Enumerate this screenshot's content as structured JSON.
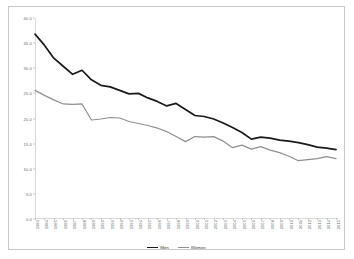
{
  "chart_data": {
    "type": "line",
    "title": "",
    "xlabel": "",
    "ylabel": "",
    "ylim": [
      0.0,
      40.0
    ],
    "yticks": [
      "0.0",
      "5.0",
      "10.0",
      "15.0",
      "20.0",
      "25.0",
      "30.0",
      "35.0",
      "40.0"
    ],
    "grid": false,
    "legend_position": "bottom",
    "x": [
      "1983",
      "1984",
      "1985",
      "1986",
      "1987",
      "1988",
      "1989",
      "1990",
      "1991",
      "1992",
      "1993",
      "1994",
      "1995",
      "1996",
      "1997",
      "1998",
      "1999",
      "2000",
      "2001",
      "2002",
      "2003",
      "2004",
      "2005",
      "2006",
      "2007",
      "2008",
      "2009",
      "2010",
      "2011",
      "2012",
      "2013",
      "2014",
      "2015"
    ],
    "series": [
      {
        "name": "Men",
        "color": "#1a1a1a",
        "values": [
          36.8,
          34.6,
          32.0,
          30.4,
          28.8,
          29.6,
          27.7,
          26.6,
          26.3,
          25.6,
          24.9,
          25.0,
          24.1,
          23.4,
          22.5,
          23.0,
          21.8,
          20.6,
          20.4,
          19.9,
          19.1,
          18.2,
          17.2,
          15.9,
          16.3,
          16.1,
          15.7,
          15.5,
          15.2,
          14.8,
          14.3,
          14.1,
          13.8
        ]
      },
      {
        "name": "Women",
        "color": "#8f8f8f",
        "values": [
          25.6,
          24.6,
          23.7,
          22.9,
          22.8,
          22.9,
          19.7,
          19.9,
          20.2,
          20.1,
          19.4,
          19.0,
          18.6,
          18.1,
          17.4,
          16.4,
          15.4,
          16.4,
          16.3,
          16.4,
          15.5,
          14.2,
          14.7,
          13.9,
          14.4,
          13.7,
          13.2,
          12.5,
          11.6,
          11.8,
          12.0,
          12.4,
          12.0
        ]
      }
    ]
  },
  "legend": {
    "items": [
      {
        "label": "Men",
        "color": "#1a1a1a"
      },
      {
        "label": "Women",
        "color": "#8f8f8f"
      }
    ]
  }
}
